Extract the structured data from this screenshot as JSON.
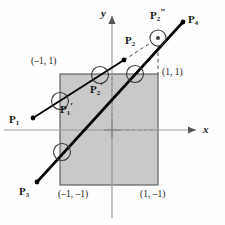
{
  "figure": {
    "type": "geometry-diagram"
  },
  "colors": {
    "clip_window_fill": "#c9c9c9",
    "clip_window_border": "#555555",
    "axis": "#9a9a9a",
    "line": "#000000",
    "label": "#1a1a1a",
    "background": "#fefefe"
  },
  "axes": {
    "x_label": "x",
    "y_label": "y",
    "x_axis_y": 130,
    "y_axis_x": 112
  },
  "clip_window": {
    "name": "clip-rectangle",
    "left": 60,
    "top": 74,
    "right": 158,
    "bottom": 185,
    "corners": [
      {
        "id": "top-left",
        "label": "(–1, 1)",
        "x": 31,
        "y": 57
      },
      {
        "id": "top-right",
        "label": "(1, 1)",
        "x": 162,
        "y": 68
      },
      {
        "id": "bottom-left",
        "label": "(–1, –1)",
        "x": 58,
        "y": 190
      },
      {
        "id": "bottom-right",
        "label": "(1, –1)",
        "x": 140,
        "y": 190
      }
    ]
  },
  "segments": [
    {
      "id": "segment-p1-p2",
      "name": "line-p1-p2",
      "from": {
        "x": 33,
        "y": 118
      },
      "to": {
        "x": 124,
        "y": 60
      },
      "width": 1.8,
      "style": "solid"
    },
    {
      "id": "segment-p3-p4",
      "name": "line-p3-p4",
      "from": {
        "x": 37,
        "y": 182
      },
      "to": {
        "x": 183,
        "y": 22
      },
      "width": 2.6,
      "style": "solid"
    },
    {
      "id": "segment-p2-p2dprime",
      "name": "dashed-extension-p2",
      "from": {
        "x": 124,
        "y": 60
      },
      "to": {
        "x": 158,
        "y": 38
      },
      "width": 1.0,
      "style": "dashed"
    },
    {
      "id": "segment-vertical-dash",
      "name": "dashed-vertical-right-edge",
      "from": {
        "x": 158,
        "y": 46
      },
      "to": {
        "x": 158,
        "y": 74
      },
      "width": 1.0,
      "style": "dashed"
    }
  ],
  "endpoints": [
    {
      "id": "p1",
      "name": "endpoint-p1",
      "x": 33,
      "y": 118
    },
    {
      "id": "p2",
      "name": "endpoint-p2",
      "x": 124,
      "y": 60
    },
    {
      "id": "p3",
      "name": "endpoint-p3",
      "x": 37,
      "y": 182
    },
    {
      "id": "p4",
      "name": "endpoint-p4",
      "x": 183,
      "y": 22
    }
  ],
  "intersection_circles": [
    {
      "id": "c-p1prime",
      "name": "circle-p1-prime",
      "cx": 60,
      "cy": 101,
      "r": 8.5
    },
    {
      "id": "c-p2prime",
      "name": "circle-p2-prime",
      "cx": 100,
      "cy": 75,
      "r": 8.5
    },
    {
      "id": "c-right",
      "name": "circle-right-edge",
      "cx": 135,
      "cy": 74,
      "r": 8.5
    },
    {
      "id": "c-bottom",
      "name": "circle-bottom-edge",
      "cx": 62,
      "cy": 152,
      "r": 8.5
    },
    {
      "id": "c-p2dprime",
      "name": "circle-p2-double-prime",
      "cx": 158,
      "cy": 38,
      "r": 8.0
    }
  ],
  "point_labels": [
    {
      "id": "lbl-p1",
      "name": "label-p1",
      "base": "P",
      "sub": "1",
      "prime": "",
      "x": 9,
      "y": 113
    },
    {
      "id": "lbl-p1prime",
      "name": "label-p1-prime",
      "base": "P",
      "sub": "1",
      "prime": "′",
      "x": 60,
      "y": 103
    },
    {
      "id": "lbl-p2",
      "name": "label-p2",
      "base": "P",
      "sub": "2",
      "prime": "",
      "x": 125,
      "y": 34
    },
    {
      "id": "lbl-p2prime",
      "name": "label-p2-prime",
      "base": "P",
      "sub": "2",
      "prime": "′",
      "x": 90,
      "y": 83
    },
    {
      "id": "lbl-p2dprime",
      "name": "label-p2-double-prime",
      "base": "P",
      "sub": "2",
      "prime": "″",
      "x": 150,
      "y": 9
    },
    {
      "id": "lbl-p3",
      "name": "label-p3",
      "base": "P",
      "sub": "3",
      "prime": "",
      "x": 19,
      "y": 185
    },
    {
      "id": "lbl-p4",
      "name": "label-p4",
      "base": "P",
      "sub": "4",
      "prime": "",
      "x": 188,
      "y": 13
    }
  ]
}
